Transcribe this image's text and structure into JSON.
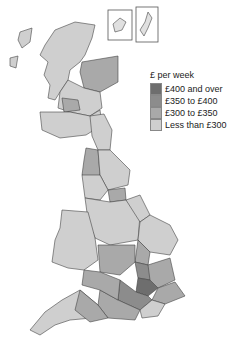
{
  "legend": {
    "title": "£ per week",
    "items": [
      {
        "label": "£400 and over",
        "color": "#6e6e6e"
      },
      {
        "label": "£350 to £400",
        "color": "#8c8c8c"
      },
      {
        "label": "£300 to £350",
        "color": "#a9a9a9"
      },
      {
        "label": "Less than £300",
        "color": "#cfcfcf"
      }
    ]
  },
  "insets": [
    {
      "name": "Orkney Islands"
    },
    {
      "name": "Shetland Islands"
    }
  ]
}
